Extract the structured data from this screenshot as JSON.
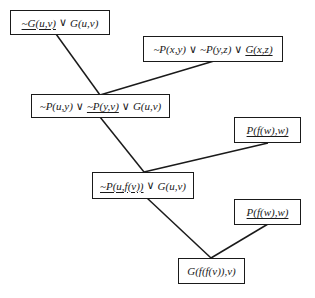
{
  "diagram": {
    "type": "resolution-refutation-tree",
    "nodes": [
      {
        "id": "n1",
        "parts": [
          {
            "text": "~G(u,v)",
            "underline": true
          },
          {
            "text": " ∨ ",
            "op": true
          },
          {
            "text": "G(u,v)"
          }
        ]
      },
      {
        "id": "n2",
        "parts": [
          {
            "text": "~P(x,y)"
          },
          {
            "text": " ∨ ",
            "op": true
          },
          {
            "text": "~P(y,z)"
          },
          {
            "text": " ∨ ",
            "op": true
          },
          {
            "text": "G(x,z)",
            "underline": true
          }
        ]
      },
      {
        "id": "n3",
        "parts": [
          {
            "text": "~P(u,y)"
          },
          {
            "text": " ∨ ",
            "op": true
          },
          {
            "text": "~P(y,v)",
            "underline": true
          },
          {
            "text": " ∨ ",
            "op": true
          },
          {
            "text": "G(u,v)"
          }
        ]
      },
      {
        "id": "n4",
        "parts": [
          {
            "text": "P(f(w),w)",
            "underline": true
          }
        ]
      },
      {
        "id": "n5",
        "parts": [
          {
            "text": "~P(u,f(v))",
            "underline": true
          },
          {
            "text": " ∨ ",
            "op": true
          },
          {
            "text": "G(u,v)"
          }
        ]
      },
      {
        "id": "n6",
        "parts": [
          {
            "text": "P(f(w),w)",
            "underline": true
          }
        ]
      },
      {
        "id": "n7",
        "parts": [
          {
            "text": "G(f(f(v)),v)"
          }
        ]
      }
    ],
    "edges": [
      {
        "from": "n1",
        "to": "n3"
      },
      {
        "from": "n2",
        "to": "n3"
      },
      {
        "from": "n3",
        "to": "n5"
      },
      {
        "from": "n4",
        "to": "n5"
      },
      {
        "from": "n5",
        "to": "n7"
      },
      {
        "from": "n6",
        "to": "n7"
      }
    ],
    "colors": {
      "stroke": "#1a1a1a",
      "background": "#ffffff"
    }
  }
}
